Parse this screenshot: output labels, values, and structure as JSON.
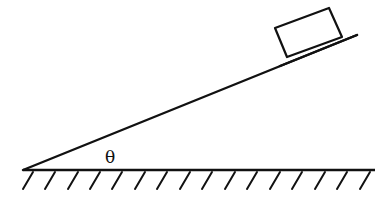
{
  "diagram": {
    "type": "inclined-plane",
    "angle_label": "θ",
    "elements": [
      "incline",
      "block",
      "ground",
      "ground-hatching",
      "angle-label"
    ],
    "colors": {
      "stroke": "#111111",
      "background": "#ffffff"
    }
  }
}
